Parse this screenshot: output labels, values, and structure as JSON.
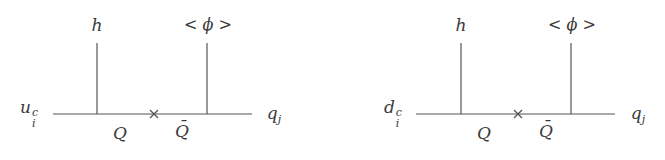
{
  "diagrams": [
    {
      "name": "up-type",
      "incoming": {
        "base": "u",
        "sup": "c",
        "sub": "i"
      },
      "outgoing": {
        "base": "q",
        "sub": "j"
      },
      "top_left_label": "h",
      "top_right_label": "< ϕ >",
      "propagator_left": "Q",
      "propagator_right": "Q̄"
    },
    {
      "name": "down-type",
      "incoming": {
        "base": "d",
        "sup": "c",
        "sub": "i"
      },
      "outgoing": {
        "base": "q",
        "sub": "j"
      },
      "top_left_label": "h",
      "top_right_label": "< ϕ >",
      "propagator_left": "Q",
      "propagator_right": "Q̄"
    }
  ],
  "mass_insertion_symbol": "×",
  "line_color": "#555555"
}
